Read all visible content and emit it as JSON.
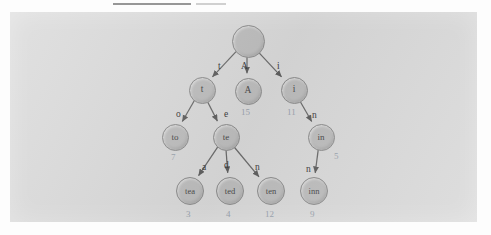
{
  "figure": {
    "kind": "trie-diagram",
    "colors": {
      "page_background": "#fdfdfd",
      "panel_background": "#d9d9d9",
      "node_fill": "#bdbdbd",
      "node_stroke": "#8e8e8e",
      "node_text": "#4a4a4a",
      "edge_stroke": "#6b6b6b",
      "edge_label_text": "#3c3c3c",
      "value_text": "#9aa3ae"
    },
    "nodes": [
      {
        "id": "root",
        "label": "",
        "value": null,
        "x": 247,
        "y": 40,
        "r": 15.5,
        "font": 10
      },
      {
        "id": "t",
        "label": "t",
        "value": null,
        "x": 201,
        "y": 89,
        "r": 12.5,
        "font": 9.5
      },
      {
        "id": "A",
        "label": "A",
        "value": "15",
        "x": 247,
        "y": 90,
        "r": 12.5,
        "font": 9.5
      },
      {
        "id": "i",
        "label": "i",
        "value": "11",
        "x": 293,
        "y": 89,
        "r": 12.5,
        "font": 9.5
      },
      {
        "id": "to",
        "label": "to",
        "value": "7",
        "x": 174,
        "y": 136,
        "r": 12.5,
        "font": 9
      },
      {
        "id": "te",
        "label": "te",
        "value": null,
        "x": 225,
        "y": 136,
        "r": 12.5,
        "font": 9
      },
      {
        "id": "in",
        "label": "in",
        "value": "5",
        "x": 320,
        "y": 136,
        "r": 12.5,
        "font": 9
      },
      {
        "id": "tea",
        "label": "tea",
        "value": "3",
        "x": 189,
        "y": 190,
        "r": 13,
        "font": 8.5
      },
      {
        "id": "ted",
        "label": "ted",
        "value": "4",
        "x": 229,
        "y": 190,
        "r": 13,
        "font": 8.5
      },
      {
        "id": "ten",
        "label": "ten",
        "value": "12",
        "x": 270,
        "y": 190,
        "r": 13,
        "font": 8.5
      },
      {
        "id": "inn",
        "label": "inn",
        "value": "9",
        "x": 313,
        "y": 190,
        "r": 13,
        "font": 8.5
      }
    ],
    "edges": [
      {
        "from": "root",
        "to": "t",
        "label": "t",
        "lx": 218,
        "ly": 62
      },
      {
        "from": "root",
        "to": "A",
        "label": "A",
        "lx": 241,
        "ly": 62
      },
      {
        "from": "root",
        "to": "i",
        "label": "i",
        "lx": 277,
        "ly": 62
      },
      {
        "from": "t",
        "to": "to",
        "label": "o",
        "lx": 176,
        "ly": 110
      },
      {
        "from": "t",
        "to": "te",
        "label": "e",
        "lx": 224,
        "ly": 110
      },
      {
        "from": "te",
        "to": "tea",
        "label": "a",
        "lx": 202,
        "ly": 163
      },
      {
        "from": "te",
        "to": "ted",
        "label": "d",
        "lx": 224,
        "ly": 161
      },
      {
        "from": "te",
        "to": "ten",
        "label": "n",
        "lx": 255,
        "ly": 163
      },
      {
        "from": "i",
        "to": "in",
        "label": "n",
        "lx": 312,
        "ly": 111
      },
      {
        "from": "in",
        "to": "inn",
        "label": "n",
        "lx": 306,
        "ly": 165
      }
    ],
    "values_layout": [
      {
        "for": "A",
        "vx": 241,
        "vy": 108
      },
      {
        "for": "i",
        "vx": 287,
        "vy": 108
      },
      {
        "for": "to",
        "vx": 171,
        "vy": 153
      },
      {
        "for": "in",
        "vx": 334,
        "vy": 152
      },
      {
        "for": "tea",
        "vx": 186,
        "vy": 210
      },
      {
        "for": "ted",
        "vx": 226,
        "vy": 210
      },
      {
        "for": "ten",
        "vx": 265,
        "vy": 210
      },
      {
        "for": "inn",
        "vx": 310,
        "vy": 210
      }
    ]
  }
}
